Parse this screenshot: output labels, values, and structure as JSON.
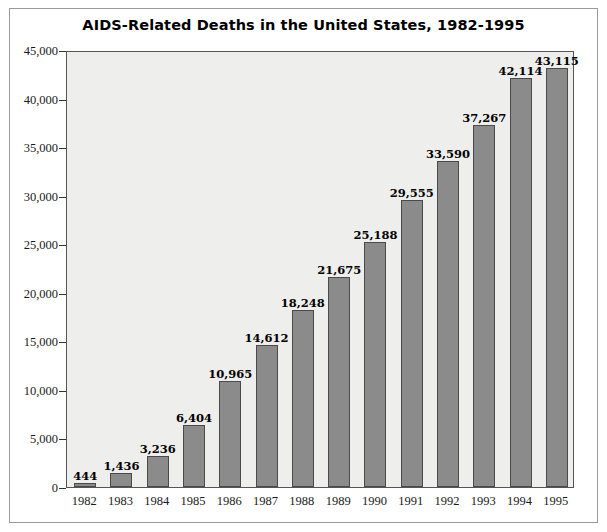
{
  "chart_data": {
    "type": "bar",
    "title": "AIDS-Related Deaths in the United States, 1982-1995",
    "xlabel": "",
    "ylabel": "",
    "categories": [
      "1982",
      "1983",
      "1984",
      "1985",
      "1986",
      "1987",
      "1988",
      "1989",
      "1990",
      "1991",
      "1992",
      "1993",
      "1994",
      "1995"
    ],
    "values": [
      444,
      1436,
      3236,
      6404,
      10965,
      14612,
      18248,
      21675,
      25188,
      29555,
      33590,
      37267,
      42114,
      43115
    ],
    "value_labels": [
      "444",
      "1,436",
      "3,236",
      "6,404",
      "10,965",
      "14,612",
      "18,248",
      "21,675",
      "25,188",
      "29,555",
      "33,590",
      "37,267",
      "42,114",
      "43,115"
    ],
    "ylim": [
      0,
      45000
    ],
    "yticks": [
      0,
      5000,
      10000,
      15000,
      20000,
      25000,
      30000,
      35000,
      40000,
      45000
    ],
    "ytick_labels": [
      "0",
      "5,000",
      "10,000",
      "15,000",
      "20,000",
      "25,000",
      "30,000",
      "35,000",
      "40,000",
      "45,000"
    ],
    "grid": false,
    "legend": "none",
    "bar_color": "#8b8b8b",
    "bar_edge_color": "#4a4a4a",
    "plot_background": "#eeeeec",
    "frame_color": "#555555"
  }
}
